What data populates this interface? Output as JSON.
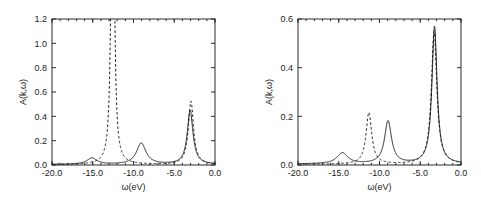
{
  "figure": {
    "background": "#ffffff",
    "curve_color": "#1a1a1a",
    "axis_color": "#2b2b2b"
  },
  "chart_data": [
    {
      "type": "line",
      "panel": "left",
      "title": "",
      "xlabel": "ω(eV)",
      "ylabel": "A(k,ω)",
      "xlim": [
        -20.0,
        0.0
      ],
      "ylim": [
        0.0,
        1.2
      ],
      "xticks": [
        -20.0,
        -15.0,
        -10.0,
        -5.0,
        0.0
      ],
      "xticklabels": [
        "-20.0",
        "-15.0",
        "-10.0",
        "-5.0",
        "0.0"
      ],
      "yticks": [
        0.0,
        0.2,
        0.4,
        0.6,
        0.8,
        1.0,
        1.2
      ],
      "yticklabels": [
        "0.0",
        "0.2",
        "0.4",
        "0.6",
        "0.8",
        "1.0",
        "1.2"
      ],
      "grid": false,
      "legend": "none",
      "series": [
        {
          "name": "solid",
          "style": "solid",
          "peaks": [
            {
              "center": -15.1,
              "height": 0.052,
              "width": 0.75
            },
            {
              "center": -9.05,
              "height": 0.175,
              "width": 0.7
            },
            {
              "center": -3.05,
              "height": 0.445,
              "width": 0.42
            }
          ],
          "baseline": 0.004
        },
        {
          "name": "dashed",
          "style": "dashed",
          "peaks": [
            {
              "center": -12.55,
              "height": 3.4,
              "width": 0.2
            },
            {
              "center": -2.95,
              "height": 0.52,
              "width": 0.38
            }
          ],
          "baseline": 0.003
        }
      ]
    },
    {
      "type": "line",
      "panel": "right",
      "title": "",
      "xlabel": "ω(eV)",
      "ylabel": "A(k,ω)",
      "xlim": [
        -20.0,
        0.0
      ],
      "ylim": [
        0.0,
        0.6
      ],
      "xticks": [
        -20.0,
        -15.0,
        -10.0,
        -5.0,
        0.0
      ],
      "xticklabels": [
        "-20.0",
        "-15.0",
        "-10.0",
        "-5.0",
        "0.0"
      ],
      "yticks": [
        0.0,
        0.2,
        0.4,
        0.6
      ],
      "yticklabels": [
        "0.0",
        "0.2",
        "0.4",
        "0.6"
      ],
      "grid": false,
      "legend": "none",
      "series": [
        {
          "name": "solid",
          "style": "solid",
          "peaks": [
            {
              "center": -14.55,
              "height": 0.045,
              "width": 0.8
            },
            {
              "center": -8.95,
              "height": 0.175,
              "width": 0.52
            },
            {
              "center": -3.25,
              "height": 0.565,
              "width": 0.38
            }
          ],
          "baseline": 0.004
        },
        {
          "name": "dashed",
          "style": "dashed",
          "peaks": [
            {
              "center": -11.3,
              "height": 0.212,
              "width": 0.42
            },
            {
              "center": -3.3,
              "height": 0.545,
              "width": 0.4
            }
          ],
          "baseline": 0.003
        }
      ]
    }
  ]
}
